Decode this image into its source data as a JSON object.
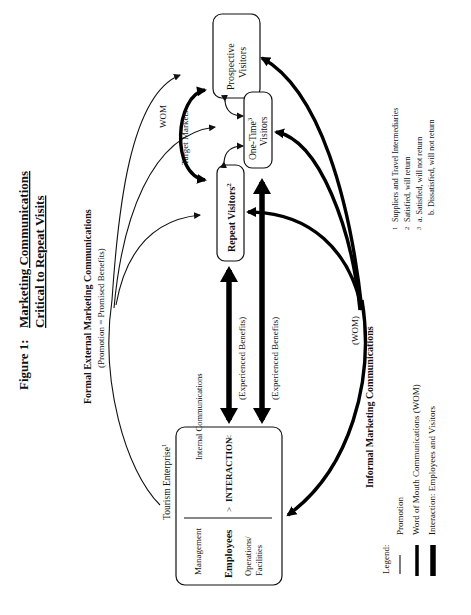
{
  "figure": {
    "title_line1": "Figure 1:",
    "title_line1b": "Marketing  Communications",
    "title_line2": "Critical  to  Repeat  Visits"
  },
  "formal": {
    "heading": "Formal External Marketing Communications",
    "subheading": "(Promotion = Promised Benefits)"
  },
  "informal": {
    "heading": "Informal  Marketing  Communications",
    "wom": "(WOM)"
  },
  "nodes": {
    "prospective": {
      "line1": "Prospective",
      "line2": "Visitors"
    },
    "one_time": {
      "line1": "One-Time",
      "sup": "3",
      "line2": "Visitors"
    },
    "repeat": {
      "label": "Repeat  Visitors",
      "sup": "2"
    }
  },
  "labels": {
    "wom": "WOM",
    "target_markets": "Target Markets",
    "experienced_benefits_1": "(Experienced Benefits)",
    "experienced_benefits_2": "(Experienced Benefits)",
    "internal_communications": "Internal Communications"
  },
  "enterprise": {
    "title": "Tourism Enterprise",
    "title_sup": "1",
    "management": "Management",
    "employees": "Employees",
    "operations_line1": "Operations/",
    "operations_line2": "Facilities",
    "interaction": "INTERACTION"
  },
  "legend": {
    "title": "Legend:",
    "items": [
      {
        "label": "Promotion",
        "style": "thin"
      },
      {
        "label": "Word of Mouth Communications (WOM)",
        "style": "thick"
      },
      {
        "label": "Interaction:  Employees and Visitors",
        "style": "very-thick"
      }
    ]
  },
  "footnotes": [
    {
      "num": "1",
      "text": "Suppliers and Travel Intermediaries"
    },
    {
      "num": "2",
      "text": "Satisfied, will return"
    },
    {
      "num": "3",
      "text": "a.  Satisfied, will not return"
    },
    {
      "num": "",
      "text": "b.  Dissatisfied, will not return"
    }
  ],
  "colors": {
    "ink": "#111111",
    "background": "#ffffff"
  }
}
